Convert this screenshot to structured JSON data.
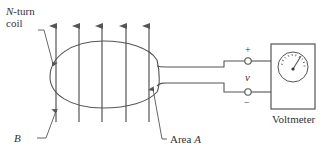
{
  "diagram": {
    "type": "faraday-induction-coil",
    "labels": {
      "coil_var": "N",
      "coil_suffix": "-turn",
      "coil_line2": "coil",
      "field": "B",
      "area_prefix": "Area ",
      "area_var": "A",
      "plus": "+",
      "voltage": "v",
      "minus": "−",
      "meter": "Voltmeter"
    },
    "field_arrow_count": 5,
    "colors": {
      "stroke": "#555555",
      "text": "#333333",
      "background": "#ffffff"
    }
  }
}
